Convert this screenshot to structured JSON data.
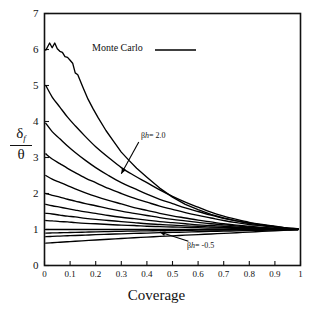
{
  "chart_data": {
    "type": "line",
    "title": "",
    "xlabel": "Coverage",
    "ylabel": "δ_f / θ",
    "xlim": [
      0,
      1
    ],
    "ylim": [
      0,
      7
    ],
    "xticks": [
      "0",
      "0.1",
      "0.2",
      "0.3",
      "0.4",
      "0.5",
      "0.6",
      "0.7",
      "0.8",
      "0.9",
      "1"
    ],
    "xtick_values": [
      0,
      0.1,
      0.2,
      0.3,
      0.4,
      0.5,
      0.6,
      0.7,
      0.8,
      0.9,
      1
    ],
    "yticks": [
      "0",
      "1",
      "2",
      "3",
      "4",
      "5",
      "6",
      "7"
    ],
    "ytick_values": [
      0,
      1,
      2,
      3,
      4,
      5,
      6,
      7
    ],
    "grid": false,
    "legend_position": "top-center",
    "legend": [
      {
        "label": "Monte Carlo",
        "style": "solid-line"
      }
    ],
    "annotations": [
      {
        "text": "βh = 2.0",
        "beta_h": 2.0,
        "x": 0.38,
        "y": 3.35,
        "arrow_to_x": 0.3,
        "arrow_to_y": 2.55
      },
      {
        "text": "βh = -0.5",
        "beta_h": -0.5,
        "x": 0.57,
        "y": 0.7,
        "arrow_to_x": 0.45,
        "arrow_to_y": 0.93
      }
    ],
    "series": [
      {
        "name": "βh = 2.0 (Monte Carlo)",
        "beta_h": 2.0,
        "y0": 6.0,
        "y_end": 1.0,
        "x": [
          0.005,
          0.02,
          0.03,
          0.04,
          0.05,
          0.06,
          0.07,
          0.08,
          0.09,
          0.1,
          0.11,
          0.12,
          0.13,
          0.15,
          0.17,
          0.19,
          0.21,
          0.24,
          0.27,
          0.3,
          0.33,
          0.36,
          0.4,
          0.45,
          0.5,
          0.55,
          0.6,
          0.65,
          0.7,
          0.75,
          0.8,
          0.85,
          0.9,
          0.95,
          0.99
        ],
        "y": [
          5.98,
          6.18,
          6.05,
          6.18,
          6.02,
          5.95,
          5.92,
          5.8,
          5.78,
          5.7,
          5.62,
          5.35,
          5.3,
          4.95,
          4.62,
          4.35,
          4.1,
          3.75,
          3.45,
          3.15,
          2.92,
          2.7,
          2.45,
          2.15,
          1.9,
          1.7,
          1.55,
          1.42,
          1.32,
          1.24,
          1.18,
          1.13,
          1.08,
          1.04,
          1.02
        ]
      },
      {
        "name": "βh = 1.5",
        "beta_h": 1.5,
        "y0": 5.0,
        "y_end": 1.0,
        "x": [
          0.005,
          0.03,
          0.06,
          0.09,
          0.12,
          0.16,
          0.2,
          0.25,
          0.3,
          0.35,
          0.4,
          0.45,
          0.5,
          0.55,
          0.6,
          0.65,
          0.7,
          0.75,
          0.8,
          0.85,
          0.9,
          0.95,
          0.99
        ],
        "y": [
          5.0,
          4.68,
          4.4,
          4.12,
          3.88,
          3.58,
          3.3,
          3.0,
          2.72,
          2.5,
          2.3,
          2.1,
          1.92,
          1.76,
          1.62,
          1.48,
          1.37,
          1.28,
          1.2,
          1.14,
          1.09,
          1.04,
          1.02
        ]
      },
      {
        "name": "βh = 1.2",
        "beta_h": 1.2,
        "y0": 3.95,
        "y_end": 1.0,
        "x": [
          0.005,
          0.03,
          0.06,
          0.09,
          0.12,
          0.16,
          0.2,
          0.25,
          0.3,
          0.35,
          0.4,
          0.45,
          0.5,
          0.55,
          0.6,
          0.65,
          0.7,
          0.75,
          0.8,
          0.85,
          0.9,
          0.95,
          0.99
        ],
        "y": [
          3.95,
          3.72,
          3.52,
          3.32,
          3.14,
          2.92,
          2.72,
          2.5,
          2.3,
          2.14,
          1.98,
          1.84,
          1.72,
          1.6,
          1.5,
          1.4,
          1.31,
          1.24,
          1.17,
          1.12,
          1.08,
          1.04,
          1.02
        ]
      },
      {
        "name": "βh = 1.0",
        "beta_h": 1.0,
        "y0": 3.1,
        "y_end": 1.0,
        "x": [
          0.005,
          0.03,
          0.06,
          0.09,
          0.12,
          0.16,
          0.2,
          0.25,
          0.3,
          0.35,
          0.4,
          0.45,
          0.5,
          0.55,
          0.6,
          0.65,
          0.7,
          0.75,
          0.8,
          0.85,
          0.9,
          0.95,
          0.99
        ],
        "y": [
          3.1,
          2.96,
          2.83,
          2.7,
          2.58,
          2.43,
          2.3,
          2.14,
          2.0,
          1.87,
          1.76,
          1.65,
          1.56,
          1.47,
          1.39,
          1.32,
          1.25,
          1.19,
          1.14,
          1.1,
          1.06,
          1.03,
          1.01
        ]
      },
      {
        "name": "βh = 0.8",
        "beta_h": 0.8,
        "y0": 2.5,
        "y_end": 1.0,
        "x": [
          0.005,
          0.03,
          0.06,
          0.09,
          0.12,
          0.16,
          0.2,
          0.25,
          0.3,
          0.35,
          0.4,
          0.45,
          0.5,
          0.55,
          0.6,
          0.65,
          0.7,
          0.75,
          0.8,
          0.85,
          0.9,
          0.95,
          0.99
        ],
        "y": [
          2.5,
          2.4,
          2.31,
          2.22,
          2.13,
          2.02,
          1.92,
          1.81,
          1.71,
          1.61,
          1.53,
          1.45,
          1.38,
          1.32,
          1.26,
          1.21,
          1.16,
          1.12,
          1.09,
          1.06,
          1.04,
          1.02,
          1.01
        ]
      },
      {
        "name": "βh = 0.6",
        "beta_h": 0.6,
        "y0": 2.0,
        "y_end": 1.0,
        "x": [
          0.005,
          0.03,
          0.06,
          0.09,
          0.12,
          0.16,
          0.2,
          0.25,
          0.3,
          0.35,
          0.4,
          0.45,
          0.5,
          0.55,
          0.6,
          0.65,
          0.7,
          0.75,
          0.8,
          0.85,
          0.9,
          0.95,
          0.99
        ],
        "y": [
          2.0,
          1.95,
          1.9,
          1.84,
          1.79,
          1.72,
          1.66,
          1.58,
          1.51,
          1.45,
          1.39,
          1.33,
          1.28,
          1.24,
          1.2,
          1.16,
          1.13,
          1.1,
          1.07,
          1.05,
          1.03,
          1.01,
          1.01
        ]
      },
      {
        "name": "βh = 0.45",
        "beta_h": 0.45,
        "y0": 1.7,
        "y_end": 1.0,
        "x": [
          0.005,
          0.03,
          0.06,
          0.09,
          0.12,
          0.16,
          0.2,
          0.25,
          0.3,
          0.35,
          0.4,
          0.45,
          0.5,
          0.55,
          0.6,
          0.65,
          0.7,
          0.75,
          0.8,
          0.85,
          0.9,
          0.95,
          0.99
        ],
        "y": [
          1.7,
          1.66,
          1.62,
          1.58,
          1.54,
          1.49,
          1.45,
          1.39,
          1.34,
          1.3,
          1.26,
          1.22,
          1.19,
          1.16,
          1.13,
          1.11,
          1.09,
          1.07,
          1.05,
          1.04,
          1.02,
          1.01,
          1.01
        ]
      },
      {
        "name": "βh = 0.3",
        "beta_h": 0.3,
        "y0": 1.45,
        "y_end": 1.0,
        "x": [
          0.005,
          0.03,
          0.06,
          0.09,
          0.12,
          0.16,
          0.2,
          0.25,
          0.3,
          0.35,
          0.4,
          0.45,
          0.5,
          0.55,
          0.6,
          0.65,
          0.7,
          0.75,
          0.8,
          0.85,
          0.9,
          0.95,
          0.99
        ],
        "y": [
          1.45,
          1.43,
          1.4,
          1.37,
          1.35,
          1.31,
          1.28,
          1.25,
          1.22,
          1.19,
          1.16,
          1.14,
          1.12,
          1.1,
          1.09,
          1.07,
          1.06,
          1.05,
          1.04,
          1.03,
          1.02,
          1.01,
          1.0
        ]
      },
      {
        "name": "βh = 0.2",
        "beta_h": 0.2,
        "y0": 1.25,
        "y_end": 1.0,
        "x": [
          0.005,
          0.03,
          0.06,
          0.09,
          0.12,
          0.16,
          0.2,
          0.25,
          0.3,
          0.35,
          0.4,
          0.45,
          0.5,
          0.55,
          0.6,
          0.65,
          0.7,
          0.75,
          0.8,
          0.85,
          0.9,
          0.95,
          0.99
        ],
        "y": [
          1.25,
          1.24,
          1.22,
          1.21,
          1.19,
          1.17,
          1.16,
          1.14,
          1.12,
          1.11,
          1.09,
          1.08,
          1.07,
          1.06,
          1.05,
          1.04,
          1.04,
          1.03,
          1.02,
          1.02,
          1.01,
          1.01,
          1.0
        ]
      },
      {
        "name": "βh = 0.0",
        "beta_h": 0.0,
        "y0": 1.0,
        "y_end": 1.0,
        "x": [
          0.005,
          0.2,
          0.4,
          0.6,
          0.8,
          0.99
        ],
        "y": [
          1.0,
          1.0,
          1.0,
          1.0,
          1.0,
          1.0
        ]
      },
      {
        "name": "βh = -0.2",
        "beta_h": -0.2,
        "y0": 0.9,
        "y_end": 1.0,
        "x": [
          0.005,
          0.03,
          0.06,
          0.09,
          0.12,
          0.16,
          0.2,
          0.25,
          0.3,
          0.35,
          0.4,
          0.45,
          0.5,
          0.55,
          0.6,
          0.65,
          0.7,
          0.75,
          0.8,
          0.85,
          0.9,
          0.95,
          0.99
        ],
        "y": [
          0.9,
          0.905,
          0.91,
          0.915,
          0.92,
          0.927,
          0.934,
          0.942,
          0.95,
          0.957,
          0.963,
          0.968,
          0.973,
          0.977,
          0.981,
          0.984,
          0.987,
          0.99,
          0.992,
          0.994,
          0.996,
          0.998,
          0.999
        ]
      },
      {
        "name": "βh = -0.35",
        "beta_h": -0.35,
        "y0": 0.8,
        "y_end": 1.0,
        "x": [
          0.005,
          0.03,
          0.06,
          0.09,
          0.12,
          0.16,
          0.2,
          0.25,
          0.3,
          0.35,
          0.4,
          0.45,
          0.5,
          0.55,
          0.6,
          0.65,
          0.7,
          0.75,
          0.8,
          0.85,
          0.9,
          0.95,
          0.99
        ],
        "y": [
          0.8,
          0.808,
          0.817,
          0.826,
          0.834,
          0.845,
          0.856,
          0.869,
          0.88,
          0.891,
          0.901,
          0.911,
          0.92,
          0.929,
          0.937,
          0.946,
          0.955,
          0.963,
          0.971,
          0.979,
          0.986,
          0.993,
          0.998
        ]
      },
      {
        "name": "βh = -0.5",
        "beta_h": -0.5,
        "y0": 0.62,
        "y_end": 1.0,
        "x": [
          0.005,
          0.03,
          0.06,
          0.09,
          0.12,
          0.16,
          0.2,
          0.25,
          0.3,
          0.35,
          0.4,
          0.45,
          0.5,
          0.55,
          0.6,
          0.65,
          0.7,
          0.75,
          0.8,
          0.85,
          0.9,
          0.95,
          0.99
        ],
        "y": [
          0.62,
          0.632,
          0.646,
          0.66,
          0.674,
          0.692,
          0.709,
          0.73,
          0.75,
          0.77,
          0.789,
          0.807,
          0.825,
          0.842,
          0.859,
          0.876,
          0.893,
          0.91,
          0.928,
          0.947,
          0.965,
          0.983,
          0.997
        ]
      }
    ]
  },
  "figure": {
    "xaxis_title": "Coverage",
    "yaxis_numerator": "δ",
    "yaxis_numerator_sub": "f",
    "yaxis_denominator": "θ",
    "legend_label": "Monte Carlo",
    "annotation_top": "βh = 2.0",
    "annotation_bottom": "βh = -0.5",
    "annotation_top_beta": "β",
    "annotation_top_h": "h",
    "annotation_top_eq": "= 2.0",
    "annotation_bottom_beta": "β",
    "annotation_bottom_h": "h",
    "annotation_bottom_eq": "= -0.5",
    "axis_color": "#111111",
    "curve_color": "#000000",
    "background": "#ffffff"
  }
}
